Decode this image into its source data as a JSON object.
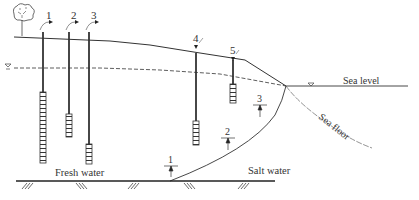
{
  "diagram": {
    "labels": {
      "fresh_water": "Fresh water",
      "salt_water": "Salt water",
      "sea_level": "Sea level",
      "sea_floor": "Sea floor"
    },
    "wells": [
      {
        "id": "1",
        "label": "1"
      },
      {
        "id": "2",
        "label": "2"
      },
      {
        "id": "3",
        "label": "3"
      },
      {
        "id": "4",
        "label": "4"
      },
      {
        "id": "5",
        "label": "5"
      }
    ],
    "interface_markers": [
      {
        "label": "1"
      },
      {
        "label": "2"
      },
      {
        "label": "3"
      }
    ],
    "icons": [
      "tree-icon",
      "water-table-symbol",
      "sea-level-symbol",
      "ground-hatch"
    ],
    "colors": {
      "line": "#333333",
      "background": "#ffffff"
    }
  }
}
